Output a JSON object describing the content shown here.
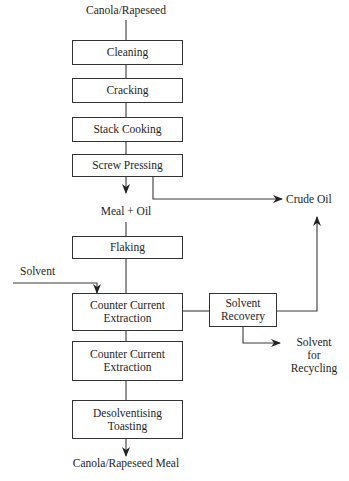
{
  "diagram": {
    "type": "process-flowchart",
    "input": "Canola/Rapeseed",
    "output": "Canola/Rapeseed Meal",
    "steps": [
      {
        "id": "cleaning",
        "label": "Cleaning"
      },
      {
        "id": "cracking",
        "label": "Cracking"
      },
      {
        "id": "stack-cooking",
        "label": "Stack Cooking"
      },
      {
        "id": "screw-pressing",
        "label": "Screw Pressing"
      },
      {
        "id": "flaking",
        "label": "Flaking"
      },
      {
        "id": "cce1",
        "label_line1": "Counter Current",
        "label_line2": "Extraction"
      },
      {
        "id": "cce2",
        "label_line1": "Counter Current",
        "label_line2": "Extraction"
      },
      {
        "id": "desolventising",
        "label_line1": "Desolventising",
        "label_line2": "Toasting"
      }
    ],
    "side_process": {
      "id": "solvent-recovery",
      "label_line1": "Solvent",
      "label_line2": "Recovery"
    },
    "intermediate": "Meal + Oil",
    "inputs_side": {
      "solvent": "Solvent"
    },
    "outputs_side": {
      "crude_oil": "Crude Oil",
      "solvent_recycling_line1": "Solvent",
      "solvent_recycling_line2": "for",
      "solvent_recycling_line3": "Recycling"
    },
    "edges": [
      [
        "Canola/Rapeseed",
        "Cleaning"
      ],
      [
        "Cleaning",
        "Cracking"
      ],
      [
        "Cracking",
        "Stack Cooking"
      ],
      [
        "Stack Cooking",
        "Screw Pressing"
      ],
      [
        "Screw Pressing",
        "Meal + Oil"
      ],
      [
        "Screw Pressing",
        "Crude Oil"
      ],
      [
        "Meal + Oil",
        "Flaking"
      ],
      [
        "Flaking",
        "Counter Current Extraction"
      ],
      [
        "Solvent",
        "Counter Current Extraction"
      ],
      [
        "Counter Current Extraction",
        "Solvent Recovery"
      ],
      [
        "Solvent Recovery",
        "Crude Oil"
      ],
      [
        "Solvent Recovery",
        "Solvent for Recycling"
      ],
      [
        "Counter Current Extraction",
        "Counter Current Extraction (2)"
      ],
      [
        "Counter Current Extraction (2)",
        "Desolventising Toasting"
      ],
      [
        "Desolventising Toasting",
        "Canola/Rapeseed Meal"
      ]
    ]
  },
  "colors": {
    "line": "#3a3a3a",
    "text": "#1e1e1e",
    "background": "#ffffff"
  }
}
